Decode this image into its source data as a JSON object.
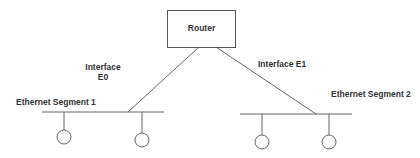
{
  "diagram": {
    "router": {
      "label": "Router"
    },
    "interfaces": [
      {
        "label_line1": "Interface",
        "label_line2": "E0"
      },
      {
        "label": "Interface E1"
      }
    ],
    "segments": [
      {
        "label": "Ethernet Segment 1",
        "hosts": 2
      },
      {
        "label": "Ethernet Segment 2",
        "hosts": 2
      }
    ],
    "colors": {
      "stroke": "#555555",
      "text": "#333333",
      "background": "#ffffff"
    }
  }
}
